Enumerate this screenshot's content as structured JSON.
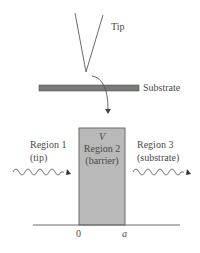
{
  "diagram": {
    "tip_label": "Tip",
    "substrate_label": "Substrate",
    "region1": {
      "line1": "Region 1",
      "line2": "(tip)"
    },
    "region2": {
      "symbol": "V",
      "line1": "Region 2",
      "line2": "(barrier)"
    },
    "region3": {
      "line1": "Region 3",
      "line2": "(substrate)"
    },
    "axis": {
      "origin": "0",
      "end": "a"
    },
    "colors": {
      "line": "#6a6a6a",
      "substrate_fill": "#7a7a7a",
      "barrier_fill": "#b9b9b9",
      "barrier_border": "#6a6a6a",
      "text": "#4a4a4a"
    }
  }
}
